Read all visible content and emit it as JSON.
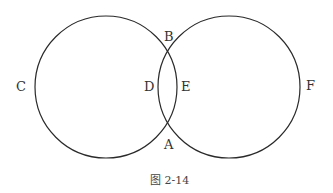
{
  "diagram": {
    "caption": "图 2-14",
    "circles": [
      {
        "name": "left-circle",
        "cx": 106,
        "cy": 87,
        "r": 71
      },
      {
        "name": "right-circle",
        "cx": 229,
        "cy": 87,
        "r": 71
      }
    ],
    "labels": {
      "A": "A",
      "B": "B",
      "C": "C",
      "D": "D",
      "E": "E",
      "F": "F"
    },
    "stroke_color": "#2a2a2a"
  }
}
